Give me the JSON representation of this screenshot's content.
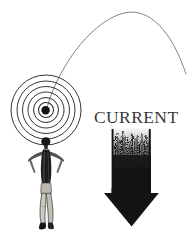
{
  "figure": {
    "labels": {
      "current": "CURRENT"
    },
    "colors": {
      "background": "#ffffff",
      "ink": "#1a1a1a",
      "ripple_line": "#2b2b2b",
      "arc_line": "#6a6a6a",
      "arrow_fill": "#141414",
      "label_text": "#3a3a3a",
      "skin_light": "#d8d4cf",
      "skin_mid": "#a09a94"
    },
    "elements": [
      {
        "name": "ripple-rings",
        "type": "concentric-circles",
        "center_x": 46,
        "center_y": 110,
        "ring_radii": [
          35,
          29,
          23.5,
          18,
          12.5,
          7.5
        ],
        "core_dot_radius": 4.2,
        "stroke_width": 0.9
      },
      {
        "name": "trajectory-arc",
        "type": "arc",
        "start_x": 46,
        "start_y": 110,
        "peak_x": 138,
        "peak_y": 12,
        "end_x": 186,
        "end_y": 74,
        "stroke_width": 0.8
      },
      {
        "name": "swimmer-figure",
        "type": "human-figure",
        "head_x": 46,
        "head_y": 141,
        "feet_y": 229,
        "height_px": 90
      },
      {
        "name": "current-arrow",
        "type": "down-arrow",
        "shaft_left_x": 112,
        "shaft_right_x": 151,
        "shaft_top_y": 129,
        "head_left_x": 104,
        "head_right_x": 159,
        "head_top_y": 193,
        "tip_x": 131,
        "tip_y": 226,
        "texture": "grainy-fade-upward"
      }
    ]
  }
}
